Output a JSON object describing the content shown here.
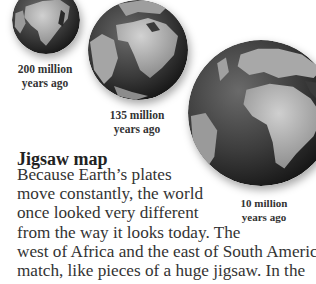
{
  "globes": [
    {
      "id": "globe-200",
      "label_line1": "200 million",
      "label_line2": "years ago"
    },
    {
      "id": "globe-135",
      "label_line1": "135 million",
      "label_line2": "years ago"
    },
    {
      "id": "globe-10",
      "label_line1": "10 million",
      "label_line2": "years ago"
    }
  ],
  "section": {
    "heading": "Jigsaw map",
    "lines": [
      "Because Earth’s plates",
      "move constantly, the world",
      "once looked very different",
      "from the way it looks today. The",
      "west of Africa and the east of South America",
      "match, like pieces of a huge jigsaw. In the"
    ]
  },
  "colors": {
    "ocean_dark": "#2b2b2b",
    "ocean_mid": "#555555",
    "land": "#b5b5b5",
    "text": "#333333"
  }
}
